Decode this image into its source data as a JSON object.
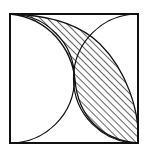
{
  "diagram": {
    "colors": {
      "stroke": "#111111",
      "background": "#ffffff",
      "hatch": "#111111"
    },
    "square": {
      "x": 10,
      "y": 14,
      "size": 128
    },
    "shapes": [
      {
        "name": "outer-square"
      },
      {
        "name": "left-semicircle-arc"
      },
      {
        "name": "right-semicircle-arc"
      },
      {
        "name": "shaded-lens-region",
        "fill": "diagonal-hatch"
      }
    ]
  }
}
